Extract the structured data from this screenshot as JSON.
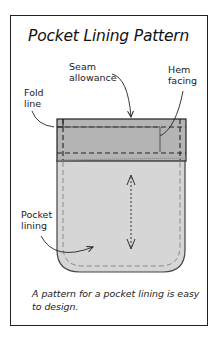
{
  "title": "Pocket Lining Pattern",
  "labels": {
    "seam_allowance": [
      "Seam",
      "allowance"
    ],
    "hem_facing": [
      "Hem",
      "facing"
    ],
    "fold_line": [
      "Fold",
      "line"
    ],
    "pocket_lining": [
      "Pocket",
      "lining"
    ]
  },
  "caption": [
    "A pattern for a pocket lining is easy",
    "to design."
  ],
  "colors": {
    "hem_band": "#b4b4b4",
    "lining": "#d6d6d6",
    "outline": "#2a2a2a",
    "seam_dash": "#7a7a7a"
  }
}
